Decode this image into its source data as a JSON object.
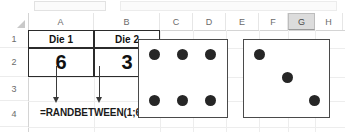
{
  "app": {
    "type": "spreadsheet",
    "select_all_icon": "select-all-triangle"
  },
  "grid": {
    "column_headers": [
      {
        "label": "A",
        "selected": false
      },
      {
        "label": "B",
        "selected": false
      },
      {
        "label": "C",
        "selected": false
      },
      {
        "label": "D",
        "selected": false
      },
      {
        "label": "E",
        "selected": false
      },
      {
        "label": "F",
        "selected": false
      },
      {
        "label": "G",
        "selected": true
      },
      {
        "label": "H",
        "selected": false
      },
      {
        "label": "I",
        "selected": false
      },
      {
        "label": "J",
        "selected": false
      }
    ],
    "row_headers": [
      "1",
      "2",
      "3",
      "4"
    ]
  },
  "cells": {
    "a1": "Die 1",
    "b1": "Die 2",
    "a2": "6",
    "b2": "3"
  },
  "annotation": {
    "formula": "=RANDBETWEEN(1;6)",
    "arrow_from_a2": "down-arrow",
    "arrow_from_b2": "down-arrow"
  },
  "dice": [
    {
      "name": "die-1",
      "value": 6,
      "pips": [
        [
          1,
          1
        ],
        [
          2,
          1
        ],
        [
          3,
          1
        ],
        [
          1,
          3
        ],
        [
          2,
          3
        ],
        [
          3,
          3
        ]
      ]
    },
    {
      "name": "die-2",
      "value": 3,
      "pips": [
        [
          1,
          1
        ],
        [
          2,
          2
        ],
        [
          3,
          3
        ]
      ]
    }
  ],
  "colors": {
    "pip": "#262626",
    "die_border": "#4a4a4a",
    "block_border": "#2b2b2b",
    "gridline": "#ededed",
    "header_text": "#6b6b6b",
    "selected_header_bg": "#dcdcdc"
  }
}
